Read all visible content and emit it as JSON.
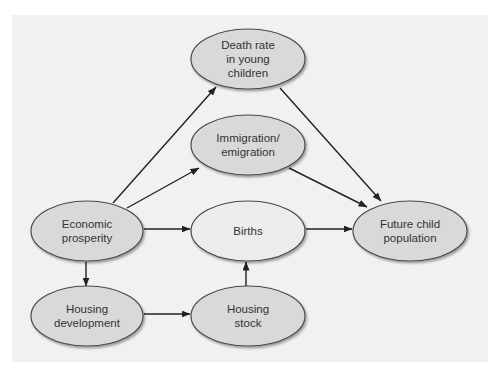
{
  "diagram": {
    "nodes": [
      {
        "id": "death_rate",
        "label": "Death rate\nin young\nchildren",
        "cx": 248,
        "cy": 59,
        "fill": "#d9d9d9"
      },
      {
        "id": "immigration",
        "label": "Immigration/\nemigration",
        "cx": 248,
        "cy": 145,
        "fill": "#d9d9d9"
      },
      {
        "id": "economic",
        "label": "Economic\nprosperity",
        "cx": 87,
        "cy": 231,
        "fill": "#d9d9d9"
      },
      {
        "id": "births",
        "label": "Births",
        "cx": 248,
        "cy": 231,
        "fill": "#ececec"
      },
      {
        "id": "future",
        "label": "Future child\npopulation",
        "cx": 410,
        "cy": 231,
        "fill": "#d9d9d9"
      },
      {
        "id": "housing_dev",
        "label": "Housing\ndevelopment",
        "cx": 87,
        "cy": 316,
        "fill": "#d9d9d9"
      },
      {
        "id": "housing_stock",
        "label": "Housing\nstock",
        "cx": 248,
        "cy": 316,
        "fill": "#d9d9d9"
      }
    ],
    "edges": [
      {
        "from": "economic",
        "to": "death_rate"
      },
      {
        "from": "economic",
        "to": "immigration"
      },
      {
        "from": "economic",
        "to": "births"
      },
      {
        "from": "economic",
        "to": "housing_dev"
      },
      {
        "from": "housing_dev",
        "to": "housing_stock"
      },
      {
        "from": "housing_stock",
        "to": "births"
      },
      {
        "from": "births",
        "to": "future"
      },
      {
        "from": "death_rate",
        "to": "future"
      },
      {
        "from": "immigration",
        "to": "future"
      }
    ],
    "colors": {
      "background": "#ffffff",
      "panel": "#f1f1f1",
      "stroke": "#4a4a4a",
      "arrow": "#222222",
      "text": "#333333"
    }
  }
}
